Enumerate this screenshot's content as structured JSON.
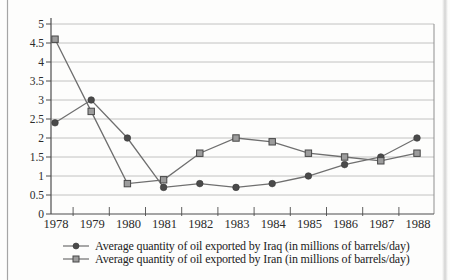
{
  "chart_data": {
    "type": "line",
    "title": "",
    "xlabel": "",
    "ylabel": "",
    "categories": [
      "1978",
      "1979",
      "1980",
      "1981",
      "1982",
      "1983",
      "1984",
      "1985",
      "1986",
      "1987",
      "1988"
    ],
    "series": [
      {
        "name": "Iraq",
        "marker": "circle",
        "legend_label": "Average quantity of oil exported by Iraq (in millions of barrels/day)",
        "values": [
          2.4,
          3.0,
          2.0,
          0.7,
          0.8,
          0.7,
          0.8,
          1.0,
          1.3,
          1.5,
          2.0
        ]
      },
      {
        "name": "Iran",
        "marker": "square",
        "legend_label": "Average quantity of oil exported by Iran (in millions of barrels/day)",
        "values": [
          4.6,
          2.7,
          0.8,
          0.9,
          1.6,
          2.0,
          1.9,
          1.6,
          1.5,
          1.4,
          1.6
        ]
      }
    ],
    "ylim": [
      0,
      5
    ],
    "ytick_step": 0.5,
    "ytick_labels": [
      "0",
      "0.5",
      "1",
      "1.5",
      "2",
      "2.5",
      "3",
      "3.5",
      "4",
      "4.5",
      "5"
    ],
    "grid": true,
    "legend_position": "bottom-left",
    "units": "millions of barrels/day"
  },
  "colors": {
    "axis": "#4d4d4d",
    "grid": "#b2b2b2",
    "series_line": "#6f6f6f",
    "iraq_marker_fill": "#4a4a4a",
    "iraq_marker_stroke": "#383838",
    "iran_marker_fill": "#9c9c9c",
    "iran_marker_stroke": "#474747",
    "tick_text": "#2b2b2b",
    "plot_border": "#8f8f8f",
    "page_edge": "#a5a5a5"
  }
}
